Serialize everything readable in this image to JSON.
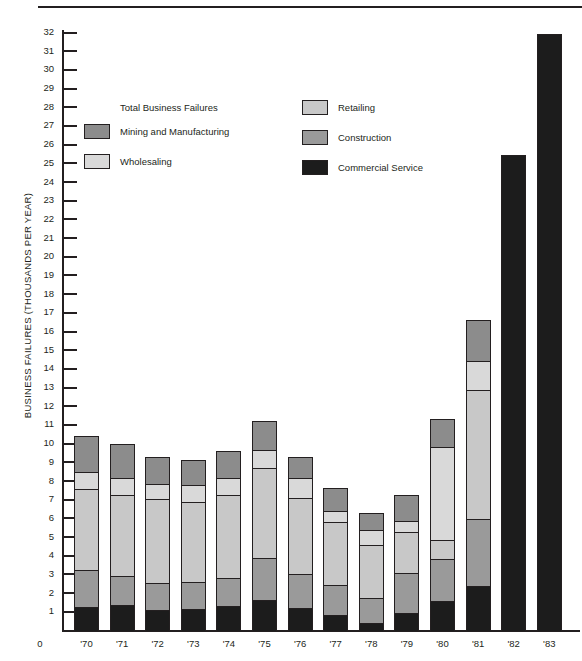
{
  "chart_data": {
    "type": "bar",
    "title": "",
    "subtype": "stacked-bar",
    "xlabel": "",
    "ylabel": "BUSINESS FAILURES (THOUSANDS PER YEAR)",
    "ylim": [
      0,
      32
    ],
    "ytick_step": 1,
    "grid": false,
    "legend_position": "inside-top-left",
    "legend_title": "Total Business Failures",
    "origin_label": "0",
    "categories": [
      "'70",
      "'71",
      "'72",
      "'73",
      "'74",
      "'75",
      "'76",
      "'77",
      "'78",
      "'79",
      "'80",
      "'81",
      "'82",
      "'83"
    ],
    "series": [
      {
        "name": "Commercial Service",
        "color": "#1c1c1c",
        "values": [
          1.35,
          1.45,
          1.2,
          1.25,
          1.4,
          1.7,
          1.3,
          0.9,
          0.5,
          1.0,
          1.65,
          2.45,
          null,
          null
        ]
      },
      {
        "name": "Construction",
        "color": "#9a9a9a",
        "values": [
          2.0,
          1.6,
          1.5,
          1.5,
          1.55,
          2.3,
          1.85,
          1.65,
          1.35,
          2.2,
          2.3,
          3.65,
          null,
          null
        ]
      },
      {
        "name": "Retailing",
        "color": "#c8c8c8",
        "values": [
          4.4,
          4.4,
          4.55,
          4.3,
          4.5,
          4.9,
          4.15,
          3.45,
          2.9,
          2.25,
          1.1,
          6.95,
          null,
          null
        ]
      },
      {
        "name": "Wholesaling",
        "color": "#d9d9d9",
        "values": [
          1.0,
          0.95,
          0.85,
          1.0,
          0.95,
          1.0,
          1.1,
          0.65,
          0.85,
          0.65,
          5.0,
          1.6,
          null,
          null
        ]
      },
      {
        "name": "Mining and Manufacturing",
        "color": "#8c8c8c",
        "values": [
          1.95,
          1.9,
          1.5,
          1.35,
          1.5,
          1.6,
          1.2,
          1.25,
          1.0,
          1.45,
          1.55,
          2.25,
          null,
          null
        ]
      },
      {
        "name": "Total Business Failures",
        "color": "#1c1c1c",
        "values": [
          null,
          null,
          null,
          null,
          null,
          null,
          null,
          null,
          null,
          null,
          null,
          null,
          25.5,
          32.0
        ]
      }
    ],
    "totals": [
      10.7,
      10.3,
      9.6,
      9.4,
      9.9,
      11.5,
      9.6,
      7.9,
      6.6,
      7.55,
      11.6,
      16.9,
      25.5,
      32.0
    ],
    "ytick_labels": [
      "1",
      "2",
      "3",
      "4",
      "5",
      "6",
      "7",
      "8",
      "9",
      "10",
      "11",
      "12",
      "13",
      "14",
      "15",
      "16",
      "17",
      "18",
      "19",
      "20",
      "21",
      "22",
      "23",
      "24",
      "25",
      "26",
      "27",
      "28",
      "29",
      "30",
      "31",
      "32"
    ]
  },
  "legend": {
    "title": "Total Business Failures",
    "entries": [
      {
        "label": "Mining and Manufacturing",
        "color": "#8c8c8c"
      },
      {
        "label": "Wholesaling",
        "color": "#d9d9d9"
      },
      {
        "label": "Retailing",
        "color": "#c8c8c8"
      },
      {
        "label": "Construction",
        "color": "#9a9a9a"
      },
      {
        "label": "Commercial Service",
        "color": "#1c1c1c"
      }
    ]
  }
}
